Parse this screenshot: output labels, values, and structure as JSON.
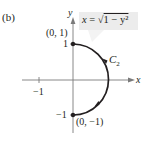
{
  "figure": {
    "part_label": "(b)",
    "equation": {
      "lhs": "x",
      "eq": " = ",
      "root_symbol": "√",
      "radicand": "1 − y²"
    },
    "curve_label": {
      "letter": "C",
      "subscript": "2"
    },
    "axes": {
      "x_label": "x",
      "y_label": "y",
      "x_ticks": [
        "−1"
      ],
      "y_ticks": [
        "1",
        "−1"
      ]
    },
    "points": [
      {
        "label": "(0, 1)"
      },
      {
        "label": "(0, −1)"
      }
    ],
    "colors": {
      "ink": "#231f20",
      "axis": "#7a7a7a",
      "callout": "#ececec"
    }
  }
}
